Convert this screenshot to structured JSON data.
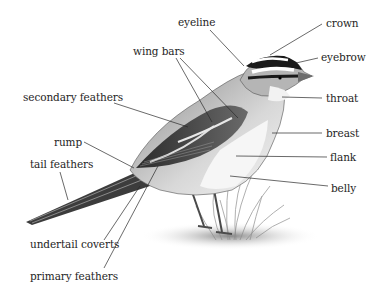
{
  "diagram": {
    "colors": {
      "background": "#ffffff",
      "text": "#1e1e1e",
      "leader_line": "#2a2a2a"
    },
    "labels": [
      {
        "id": "eyeline",
        "text": "eyeline",
        "x": 178,
        "y": 16,
        "target": [
          244,
          66
        ]
      },
      {
        "id": "crown",
        "text": "crown",
        "x": 326,
        "y": 17,
        "target": [
          270,
          55
        ]
      },
      {
        "id": "wing-bars",
        "text": "wing bars",
        "x": 133,
        "y": 45,
        "targets": [
          [
            212,
            122
          ],
          [
            238,
            118
          ]
        ]
      },
      {
        "id": "eyebrow",
        "text": "eyebrow",
        "x": 321,
        "y": 51,
        "target": [
          296,
          63
        ]
      },
      {
        "id": "secondary-feathers",
        "text": "secondary feathers",
        "x": 23,
        "y": 91,
        "target": [
          188,
          127
        ]
      },
      {
        "id": "throat",
        "text": "throat",
        "x": 326,
        "y": 92,
        "target": [
          282,
          97
        ]
      },
      {
        "id": "breast",
        "text": "breast",
        "x": 326,
        "y": 127,
        "target": [
          272,
          133
        ]
      },
      {
        "id": "rump",
        "text": "rump",
        "x": 54,
        "y": 136,
        "target": [
          134,
          168
        ]
      },
      {
        "id": "flank",
        "text": "flank",
        "x": 330,
        "y": 151,
        "target": [
          236,
          156
        ]
      },
      {
        "id": "tail-feathers",
        "text": "tail feathers",
        "x": 30,
        "y": 158,
        "target": [
          68,
          200
        ]
      },
      {
        "id": "belly",
        "text": "belly",
        "x": 331,
        "y": 182,
        "target": [
          230,
          176
        ]
      },
      {
        "id": "undertail-coverts",
        "text": "undertail coverts",
        "x": 30,
        "y": 238,
        "target": [
          140,
          186
        ]
      },
      {
        "id": "primary-feathers",
        "text": "primary feathers",
        "x": 30,
        "y": 270,
        "target": [
          158,
          166
        ]
      }
    ]
  }
}
